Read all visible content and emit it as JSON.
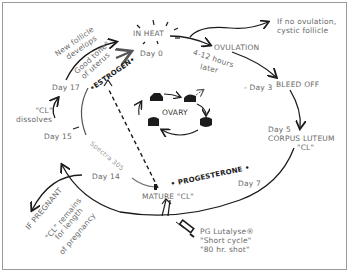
{
  "diagram": {
    "title_nodes": {
      "in_heat": "IN HEAT",
      "day0": "Day 0",
      "ovulation": "OVULATION",
      "ovulation_delay_1": "4-12 hours",
      "ovulation_delay_2": "later",
      "no_ovulation_1": "If no ovulation,",
      "no_ovulation_2": "cystic follicle",
      "day3": "- Day 3",
      "bleed_off": "BLEED OFF",
      "day5": "Day 5",
      "corpus_luteum_1": "CORPUS LUTEUM",
      "corpus_luteum_2": "\"CL\"",
      "day7": "Day 7",
      "progesterone": "• PROGESTERONE •",
      "mature_cl": "MATURE \"CL\"",
      "day14": "Day 14",
      "spectra": "Spectra 305",
      "day15": "Day 15",
      "cl_dissolves_1": "\"CL\"",
      "cl_dissolves_2": "dissolves",
      "day17": "Day 17",
      "estrogen": "•ESTROGEN•",
      "good_tone_1": "Good tone\"",
      "good_tone_2": "of uterus",
      "new_follicle_1": "New follicle",
      "new_follicle_2": "develops",
      "if_pregnant": "IF PREGNANT",
      "cl_remains_1": "\"CL\" remains",
      "cl_remains_2": "for length",
      "cl_remains_3": "of pregnancy",
      "ovary": "OVARY",
      "pg_1": "PG Lutalyse®",
      "pg_2": "\"Short cycle\"",
      "pg_3": "\"80 hr. shot\""
    },
    "colors": {
      "line": "#1c1c1c",
      "text": "#6a6a6a",
      "bold_text": "#1a1a1a",
      "light_text": "#9a9a9a",
      "frame": "#9a9a9a"
    },
    "icons": [
      "sunburst-icon",
      "follicle-icon",
      "syringe-icon",
      "arrow-icon"
    ]
  }
}
